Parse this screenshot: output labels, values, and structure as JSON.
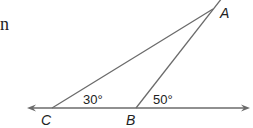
{
  "figure": {
    "type": "geometry-triangle",
    "text_fragment": "n",
    "points": {
      "A": {
        "label": "A",
        "x": 213,
        "y": 9
      },
      "B": {
        "label": "B",
        "x": 136,
        "y": 108
      },
      "C": {
        "label": "C",
        "x": 52,
        "y": 108
      }
    },
    "line": {
      "left_arrow_x": 27,
      "right_arrow_x": 250,
      "y": 108
    },
    "angles": [
      {
        "at": "C",
        "label": "30°"
      },
      {
        "at": "B",
        "label": "50°",
        "type": "exterior"
      }
    ],
    "colors": {
      "stroke": "#6b6b6b",
      "text": "#222222",
      "background": "#ffffff"
    }
  }
}
